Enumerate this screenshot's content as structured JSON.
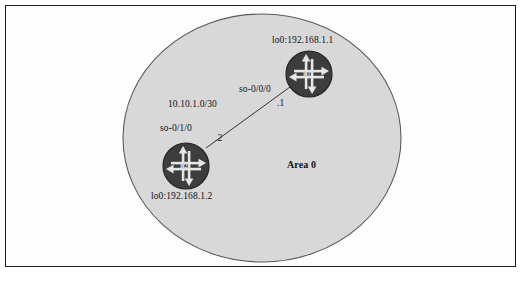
{
  "figure": {
    "frame_color": "#1b1b1b",
    "page_background": "#ffffff"
  },
  "area": {
    "label": "Area 0",
    "shape": "circle",
    "fill_color": "#d8d8d8",
    "stroke_color": "#5a5a5a"
  },
  "routers": [
    {
      "id": "R1",
      "name": "R1",
      "loopback_label": "lo0:192.168.1.1",
      "interface_label": "so-0/0/0",
      "address_suffix": ".1",
      "icon": "router-icon",
      "fill_color": "#3d3d3d",
      "arrow_color": "#e6e6e6"
    },
    {
      "id": "R2",
      "name": "R2",
      "loopback_label": "lo0:192.168.1.2",
      "interface_label": "so-0/1/0",
      "address_suffix": ".2",
      "icon": "router-icon",
      "fill_color": "#3d3d3d",
      "arrow_color": "#e6e6e6"
    }
  ],
  "link": {
    "network_label": "10.10.1.0/30",
    "stroke_color": "#333333",
    "endpoint_a": "R2",
    "endpoint_b": "R1"
  }
}
